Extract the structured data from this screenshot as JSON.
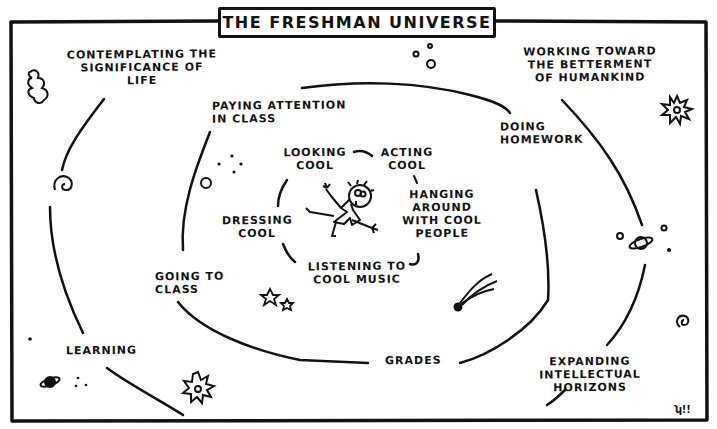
{
  "title": "THE FRESHMAN UNIVERSE",
  "signature": "ʮ!!",
  "colors": {
    "ink": "#111111",
    "paper": "#ffffff"
  },
  "outer_ring": {
    "labels": [
      {
        "id": "contemplating",
        "text": "CONTEMPLATING THE\nSIGNIFICANCE OF\nLIFE"
      },
      {
        "id": "betterment",
        "text": "WORKING TOWARD\nTHE BETTERMENT\nOF HUMANKIND"
      },
      {
        "id": "expanding",
        "text": "EXPANDING\nINTELLECTUAL\nHORIZONS"
      },
      {
        "id": "learning",
        "text": "LEARNING"
      }
    ]
  },
  "middle_ring": {
    "labels": [
      {
        "id": "paying-attention",
        "text": "PAYING ATTENTION\nIN CLASS"
      },
      {
        "id": "homework",
        "text": "DOING\nHOMEWORK"
      },
      {
        "id": "grades",
        "text": "GRADES"
      },
      {
        "id": "going-to-class",
        "text": "GOING TO\nCLASS"
      }
    ]
  },
  "inner_ring": {
    "labels": [
      {
        "id": "looking-cool",
        "text": "LOOKING\nCOOL"
      },
      {
        "id": "acting-cool",
        "text": "ACTING\nCOOL"
      },
      {
        "id": "hanging-around",
        "text": "HANGING\nAROUND\nWITH COOL\nPEOPLE"
      },
      {
        "id": "listening",
        "text": "LISTENING TO\nCOOL MUSIC"
      },
      {
        "id": "dressing-cool",
        "text": "DRESSING\nCOOL"
      }
    ]
  },
  "center": {
    "figure": "freshman-stick-figure"
  },
  "decorations": [
    "squiggle-icon",
    "spiral-galaxy-icon",
    "bubbles-icon",
    "starburst-icon",
    "planet-icon",
    "stars-icon",
    "comet-icon",
    "spiral-icon",
    "dots-icon"
  ]
}
